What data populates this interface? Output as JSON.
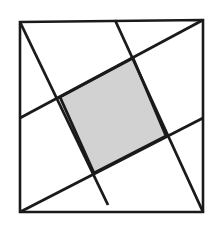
{
  "figure": {
    "kind": "geometry-diagram",
    "canvas": {
      "width": 222,
      "height": 231,
      "background": "#ffffff"
    },
    "colors": {
      "stroke": "#1a1a1a",
      "shaded_fill": "#d2d2d2",
      "shaded_stroke": "#1a1a1a",
      "page_background": "#ffffff"
    },
    "stroke_widths": {
      "outer_square": 2.6,
      "cevian_line": 2.8,
      "shaded_outline": 2.8
    },
    "outer_square": {
      "name": "outer-square",
      "corners": {
        "top_left": [
          20,
          22
        ],
        "top_right": [
          203,
          20
        ],
        "bottom_right": [
          203,
          212
        ],
        "bottom_left": [
          20,
          212
        ]
      },
      "points": "20,22 203,20 203,212 20,212"
    },
    "lines": [
      {
        "id": "line-a",
        "label": "A",
        "from": [
          20,
          22
        ],
        "to": [
          108,
          205
        ],
        "from_anchor": "top-left-corner",
        "to_anchor": "bottom-edge"
      },
      {
        "id": "line-b",
        "label": "B",
        "from": [
          20,
          118
        ],
        "to": [
          203,
          20
        ],
        "from_anchor": "left-edge",
        "to_anchor": "top-right-corner"
      },
      {
        "id": "line-c",
        "label": "C",
        "from": [
          115,
          20
        ],
        "to": [
          203,
          212
        ],
        "from_anchor": "top-edge",
        "to_anchor": "bottom-right-corner"
      },
      {
        "id": "line-d",
        "label": "D",
        "from": [
          20,
          212
        ],
        "to": [
          203,
          118
        ],
        "from_anchor": "bottom-left-corner",
        "to_anchor": "right-edge"
      }
    ],
    "shaded_region": {
      "id": "shaded-quadrilateral",
      "label": "shaded inner quadrilateral",
      "vertices": {
        "top": [
          133,
          58
        ],
        "right": [
          166,
          136
        ],
        "bottom": [
          94,
          173
        ],
        "left": [
          60,
          97
        ]
      },
      "points": "133,58 166,136 94,173 60,97"
    },
    "intersection_points": [
      {
        "id": "vertex-top",
        "at": [
          133,
          58
        ],
        "lines": [
          "line-b",
          "line-c"
        ]
      },
      {
        "id": "vertex-right",
        "at": [
          166,
          136
        ],
        "lines": [
          "line-c",
          "line-d"
        ]
      },
      {
        "id": "vertex-bottom",
        "at": [
          94,
          173
        ],
        "lines": [
          "line-a",
          "line-d"
        ]
      },
      {
        "id": "vertex-left",
        "at": [
          60,
          97
        ],
        "lines": [
          "line-a",
          "line-b"
        ]
      }
    ]
  }
}
